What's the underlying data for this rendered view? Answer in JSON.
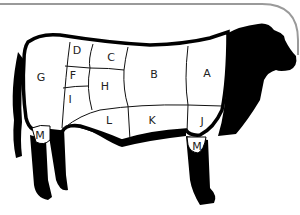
{
  "diagram": {
    "frame_color": "#9a9a9a",
    "silhouette_color": "#000000",
    "region_fill": "#ffffff",
    "regions": [
      {
        "id": "A",
        "label": "A",
        "x": 207,
        "y": 74
      },
      {
        "id": "B",
        "label": "B",
        "x": 154,
        "y": 75
      },
      {
        "id": "C",
        "label": "C",
        "x": 111,
        "y": 58
      },
      {
        "id": "D",
        "label": "D",
        "x": 77,
        "y": 51
      },
      {
        "id": "F",
        "label": "F",
        "x": 73,
        "y": 76
      },
      {
        "id": "G",
        "label": "G",
        "x": 41,
        "y": 78
      },
      {
        "id": "H",
        "label": "H",
        "x": 105,
        "y": 87
      },
      {
        "id": "I",
        "label": "I",
        "x": 70,
        "y": 100
      },
      {
        "id": "J",
        "label": "J",
        "x": 202,
        "y": 122
      },
      {
        "id": "K",
        "label": "K",
        "x": 152,
        "y": 121
      },
      {
        "id": "L",
        "label": "L",
        "x": 109,
        "y": 121
      },
      {
        "id": "M_hind",
        "label": "M",
        "x": 40,
        "y": 136
      },
      {
        "id": "M_fore",
        "label": "M",
        "x": 197,
        "y": 147
      }
    ]
  }
}
